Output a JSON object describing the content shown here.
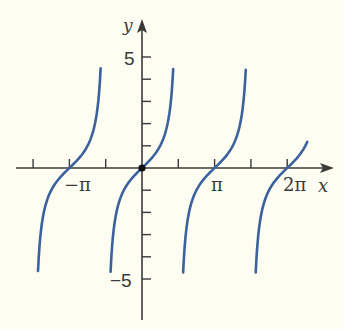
{
  "chart_data": {
    "type": "line",
    "title": "",
    "function": "y = tan x",
    "xlabel": "x",
    "ylabel": "y",
    "x_tick_labels": [
      "−π",
      "π",
      "2π"
    ],
    "x_tick_positions_in_pi": [
      -1.5,
      -1,
      -0.5,
      0,
      0.5,
      1,
      1.5,
      2
    ],
    "y_tick_labels": [
      "5",
      "−5"
    ],
    "y_tick_values": [
      -5,
      -4,
      -3,
      -2,
      -1,
      1,
      2,
      3,
      4,
      5
    ],
    "xlim": [
      -1.75,
      2.5
    ],
    "ylim": [
      -6.5,
      6.6
    ],
    "grid": false,
    "legend": null,
    "marked_point": {
      "x": 0,
      "y": 0
    },
    "series": [
      {
        "name": "branch-1",
        "x_range": [
          -4.5,
          -1.79
        ],
        "y_range": [
          -4.7,
          4.5
        ]
      },
      {
        "name": "branch-2",
        "x_range": [
          -1.36,
          1.35
        ],
        "y_range": [
          -4.7,
          4.5
        ]
      },
      {
        "name": "branch-3",
        "x_range": [
          1.78,
          4.49
        ],
        "y_range": [
          -4.7,
          4.5
        ]
      },
      {
        "name": "branch-4",
        "x_range": [
          4.92,
          7.15
        ],
        "y_range": [
          -4.7,
          2.3
        ]
      }
    ],
    "colors": {
      "curve": "#3b619e",
      "axes": "#3a3a3a",
      "background": "#fdfdf1"
    }
  },
  "labels": {
    "x_axis": "x",
    "y_axis": "y",
    "y_pos5": "5",
    "y_neg5": "−5",
    "x_negpi": "−π",
    "x_pi": "π",
    "x_2pi": "2π"
  }
}
